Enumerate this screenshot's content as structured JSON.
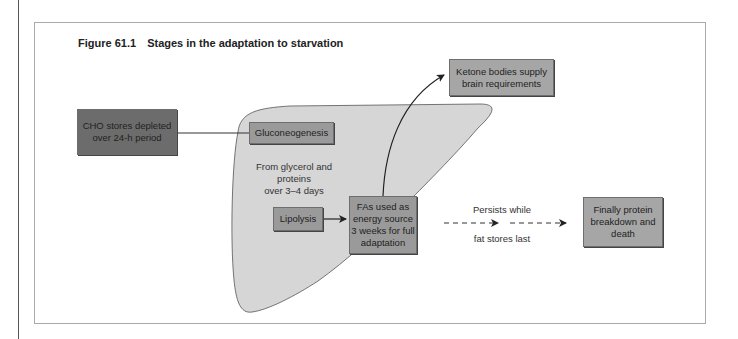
{
  "figure": {
    "number": "Figure 61.1",
    "title": "Stages in the adaptation to starvation"
  },
  "nodes": {
    "cho": {
      "line1": "CHO stores depleted",
      "line2": "over 24-h period"
    },
    "gluconeogenesis": {
      "label": "Gluconeogenesis"
    },
    "gluco_note": {
      "line1": "From glycerol and",
      "line2": "proteins",
      "line3": "over 3–4 days"
    },
    "lipolysis": {
      "label": "Lipolysis"
    },
    "fas": {
      "line1": "FAs used as",
      "line2": "energy source",
      "line3": "3 weeks for full",
      "line4": "adaptation"
    },
    "ketone": {
      "line1": "Ketone bodies supply",
      "line2": "brain requirements"
    },
    "final": {
      "line1": "Finally protein",
      "line2": "breakdown and",
      "line3": "death"
    }
  },
  "edges": {
    "persist_top": "Persists while",
    "persist_bottom": "fat stores last"
  },
  "colors": {
    "liver_fill": "#d6d6d6",
    "dark_box": "#6c6c6c",
    "mid_box": "#9a9a9a",
    "arrow": "#222222"
  }
}
